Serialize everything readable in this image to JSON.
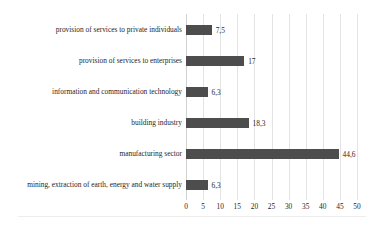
{
  "chart_data": {
    "type": "bar",
    "orientation": "horizontal",
    "title": "",
    "subtitle": "",
    "xlabel": "",
    "ylabel": "",
    "xlim": [
      0,
      50
    ],
    "xticks": [
      "0",
      "5",
      "10",
      "15",
      "20",
      "25",
      "30",
      "35",
      "40",
      "45",
      "50"
    ],
    "xtick_values": [
      0,
      5,
      10,
      15,
      20,
      25,
      30,
      35,
      40,
      45,
      50
    ],
    "grid": "vertical",
    "legend": "none",
    "bar_color": "#4d4d4d",
    "gridline_color": "#e3e3e3",
    "categories": [
      "provision of services to private individuals",
      "provision of services to enterprises",
      "information and communication technology",
      "building industry",
      "manufacturing sector",
      "mining, extraction of earth, energy and water supply"
    ],
    "values": [
      7.5,
      17,
      6.3,
      18.3,
      44.6,
      6.3
    ],
    "value_labels": [
      "7,5",
      "17",
      "6,3",
      "18,3",
      "44,6",
      "6,3"
    ]
  }
}
